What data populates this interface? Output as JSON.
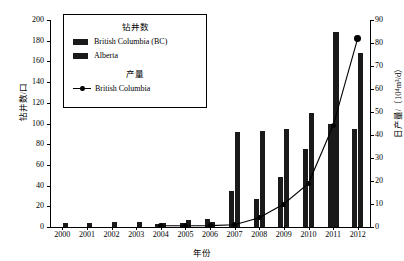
{
  "chart_data": {
    "type": "bar",
    "title": "",
    "xlabel": "年份",
    "ylabel": "钻井数/口",
    "y2label": "日产量/（10⁴m³/d）",
    "categories": [
      "2000",
      "2001",
      "2002",
      "2003",
      "2004",
      "2005",
      "2006",
      "2007",
      "2008",
      "2009",
      "2010",
      "2011",
      "2012"
    ],
    "ylim": [
      0,
      200
    ],
    "yticks": [
      0,
      20,
      40,
      60,
      80,
      100,
      120,
      140,
      160,
      180,
      200
    ],
    "y2lim": [
      0,
      90
    ],
    "y2ticks": [
      0,
      10,
      20,
      30,
      40,
      50,
      60,
      70,
      80,
      90
    ],
    "grid": false,
    "legend_position": "upper-left-inside",
    "series": [
      {
        "name": "British Columbia (BC)",
        "kind": "bar",
        "axis": "left",
        "color": "#1a1a1a",
        "values": [
          0,
          0,
          0,
          0,
          3,
          4,
          8,
          35,
          27,
          48,
          75,
          100,
          95
        ]
      },
      {
        "name": "Alberta",
        "kind": "bar",
        "axis": "left",
        "color": "#1a1a1a",
        "values": [
          4,
          4,
          5,
          5,
          4,
          7,
          5,
          92,
          93,
          95,
          110,
          188,
          168
        ]
      },
      {
        "name": "British Columbia",
        "kind": "line",
        "axis": "right",
        "color": "#000000",
        "marker": "circle",
        "values": [
          null,
          null,
          null,
          null,
          0.5,
          0.5,
          0.6,
          1,
          4,
          10,
          19,
          44,
          82
        ]
      }
    ]
  },
  "legend": {
    "heading_wells": "钻井数",
    "heading_production": "产量",
    "items_wells": [
      {
        "label": "British Columbia (BC)"
      },
      {
        "label": "Alberta"
      }
    ],
    "items_production": [
      {
        "label": "British Columbia"
      }
    ]
  }
}
